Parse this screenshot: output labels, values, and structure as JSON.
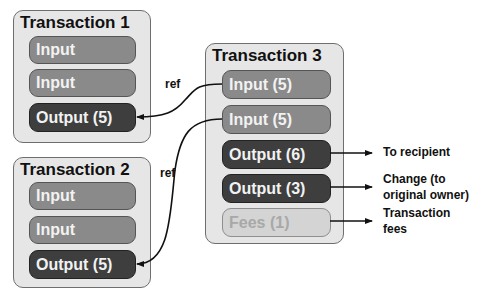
{
  "transactions": [
    {
      "title": "Transaction 1",
      "items": [
        {
          "label": "Input",
          "kind": "input"
        },
        {
          "label": "Input",
          "kind": "input"
        },
        {
          "label": "Output (5)",
          "kind": "output"
        }
      ]
    },
    {
      "title": "Transaction 2",
      "items": [
        {
          "label": "Input",
          "kind": "input"
        },
        {
          "label": "Input",
          "kind": "input"
        },
        {
          "label": "Output (5)",
          "kind": "output"
        }
      ]
    },
    {
      "title": "Transaction 3",
      "items": [
        {
          "label": "Input (5)",
          "kind": "input"
        },
        {
          "label": "Input (5)",
          "kind": "input"
        },
        {
          "label": "Output (6)",
          "kind": "output"
        },
        {
          "label": "Output (3)",
          "kind": "output"
        },
        {
          "label": "Fees (1)",
          "kind": "fees"
        }
      ]
    }
  ],
  "references": [
    {
      "label": "ref",
      "from": "Transaction 3 / Input (5) #1",
      "to": "Transaction 1 / Output (5)"
    },
    {
      "label": "ref",
      "from": "Transaction 3 / Input (5) #2",
      "to": "Transaction 2 / Output (5)"
    }
  ],
  "destinations": [
    {
      "line1": "To recipient",
      "line2": ""
    },
    {
      "line1": "Change (to",
      "line2": "original owner)"
    },
    {
      "line1": "Transaction",
      "line2": "fees"
    }
  ],
  "colors": {
    "tx_background": "#e6e6e6",
    "input_pill": "#8a8a8a",
    "output_pill": "#3e3e3e",
    "fees_pill": "#d4d4d4",
    "wire": "#111111"
  }
}
